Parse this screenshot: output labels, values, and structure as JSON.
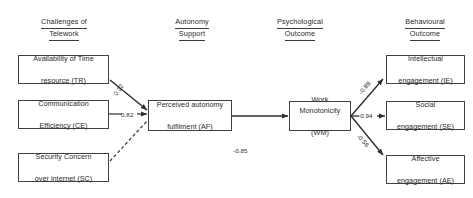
{
  "diagram": {
    "type": "path-diagram",
    "columns": [
      {
        "id": "challenges",
        "label_line1": "Challenges of",
        "label_line2": "Telework"
      },
      {
        "id": "autonomy",
        "label_line1": "Autonomy",
        "label_line2": "Support"
      },
      {
        "id": "psychological",
        "label_line1": "Psychological",
        "label_line2": "Outcome"
      },
      {
        "id": "behavioural",
        "label_line1": "Behavioural",
        "label_line2": "Outcome"
      }
    ],
    "nodes": [
      {
        "id": "TR",
        "line1": "Availability of Time",
        "line2": "resource (TR)",
        "column": "challenges"
      },
      {
        "id": "CE",
        "line1": "Communication",
        "line2": "Efficiency (CE)",
        "column": "challenges"
      },
      {
        "id": "SC",
        "line1": "Security Concern",
        "line2": "over internet (SC)",
        "column": "challenges"
      },
      {
        "id": "AF",
        "line1": "Perceived autonomy",
        "line2": "fulfilment (AF)",
        "column": "autonomy"
      },
      {
        "id": "WM",
        "line1": "Work Monotonicity",
        "line2": "(WM)",
        "column": "psychological"
      },
      {
        "id": "IE",
        "line1": "Intellectual",
        "line2": "engagement (IE)",
        "column": "behavioural"
      },
      {
        "id": "SE",
        "line1": "Social",
        "line2": "engagement (SE)",
        "column": "behavioural"
      },
      {
        "id": "AE",
        "line1": "Affective",
        "line2": "engagement (AE)",
        "column": "behavioural"
      }
    ],
    "edges": [
      {
        "id": "tr-af",
        "from": "TR",
        "to": "AF",
        "coefficient": "0.32",
        "style": "solid"
      },
      {
        "id": "ce-af",
        "from": "CE",
        "to": "AF",
        "coefficient": "0.82",
        "style": "solid"
      },
      {
        "id": "sc-af",
        "from": "SC",
        "to": "AF",
        "coefficient": "",
        "style": "dashed"
      },
      {
        "id": "af-wm",
        "from": "AF",
        "to": "WM",
        "coefficient": "-0.85",
        "style": "solid"
      },
      {
        "id": "wm-ie",
        "from": "WM",
        "to": "IE",
        "coefficient": "-0.88",
        "style": "solid"
      },
      {
        "id": "wm-se",
        "from": "WM",
        "to": "SE",
        "coefficient": "-0.94",
        "style": "solid"
      },
      {
        "id": "wm-ae",
        "from": "WM",
        "to": "AE",
        "coefficient": "-0.56",
        "style": "solid"
      }
    ],
    "colors": {
      "box_border": "#404040",
      "line": "#2f2f2f",
      "text": "#2b2b2b",
      "background": "#ffffff"
    }
  }
}
